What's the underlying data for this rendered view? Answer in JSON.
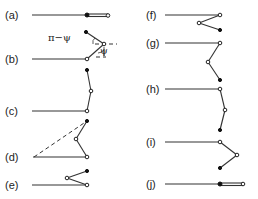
{
  "figure": {
    "panels": [
      {
        "label": "(a)",
        "id": "a"
      },
      {
        "label": "(b)",
        "id": "b"
      },
      {
        "label": "(c)",
        "id": "c"
      },
      {
        "label": "(d)",
        "id": "d"
      },
      {
        "label": "(e)",
        "id": "e"
      },
      {
        "label": "(f)",
        "id": "f"
      },
      {
        "label": "(g)",
        "id": "g"
      },
      {
        "label": "(h)",
        "id": "h"
      },
      {
        "label": "(i)",
        "id": "i"
      },
      {
        "label": "(j)",
        "id": "j"
      }
    ],
    "annotations": {
      "angle_outer": "π−ψ",
      "angle_inner": "ψ"
    },
    "legend": {
      "open_circle": "hinge joint",
      "filled_circle": "free end"
    }
  }
}
